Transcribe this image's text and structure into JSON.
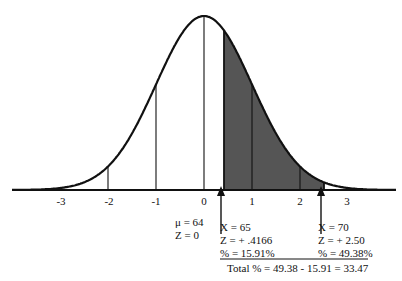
{
  "chart_data": {
    "type": "area",
    "title": "",
    "xlabel": "",
    "ylabel": "",
    "x_ticks": [
      "-3",
      "-2",
      "-1",
      "0",
      "1",
      "2",
      "3"
    ],
    "xlim": [
      -4,
      4
    ],
    "grid": false,
    "shaded_region": {
      "z_from": 0.4166,
      "z_to": 2.5,
      "color": "#555555"
    },
    "mean_annotation": {
      "mu": "μ = 64",
      "z": "Z = 0"
    },
    "left_point": {
      "x": "X = 65",
      "z": "Z = + .4166",
      "pct": "% = 15.91%"
    },
    "right_point": {
      "x": "X = 70",
      "z": "Z = + 2.50",
      "pct": "% = 49.38%"
    },
    "total": "Total % = 49.38 - 15.91 = 33.47"
  },
  "colors": {
    "line": "#111111",
    "fill": "#555555"
  }
}
